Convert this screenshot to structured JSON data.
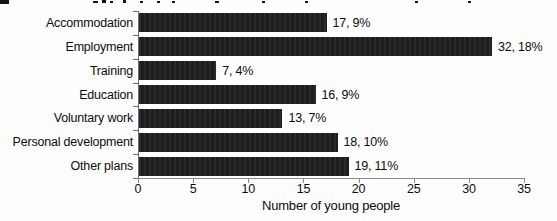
{
  "chart_data": {
    "type": "bar",
    "orientation": "horizontal",
    "title": "",
    "categories": [
      "Accommodation",
      "Employment",
      "Training",
      "Education",
      "Voluntary work",
      "Personal development",
      "Other plans"
    ],
    "values": [
      17,
      32,
      7,
      16,
      13,
      18,
      19
    ],
    "percentages": [
      9,
      18,
      4,
      9,
      7,
      10,
      11
    ],
    "data_labels": [
      "17, 9%",
      "32, 18%",
      "7, 4%",
      "16, 9%",
      "13, 7%",
      "18, 10%",
      "19, 11%"
    ],
    "xlabel": "Number of young people",
    "xlim": [
      0,
      35
    ],
    "xticks": [
      0,
      5,
      10,
      15,
      20,
      25,
      30,
      35
    ],
    "grid": false,
    "legend": false,
    "bar_color": "#1f1f1f",
    "axis_color": "#8a8a8a",
    "text_color": "#0c0c0c",
    "background_color": "#fdfdfd"
  }
}
